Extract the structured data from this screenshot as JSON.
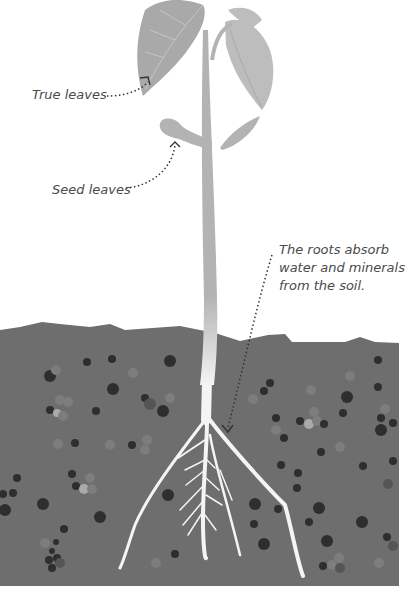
{
  "diagram": {
    "title": "",
    "labels": {
      "true_leaves": "True leaves",
      "seed_leaves": "Seed leaves",
      "roots": {
        "line1": "The roots absorb",
        "line2": "water and minerals",
        "line3": "from the soil."
      }
    },
    "parts": [
      "true-leaves",
      "seed-leaves",
      "stem",
      "roots",
      "soil"
    ],
    "colors": {
      "leaf_dark": "#a9a9a9",
      "leaf_light": "#bdbdbd",
      "stem": "#b3b3b3",
      "soil": "#6e6e6e",
      "root": "#f4f4f4",
      "pebble_dark": "#2e2e2e",
      "pebble_mid": "#555555",
      "pebble_light": "#7d7d7d",
      "text": "#4a4a4a",
      "pointer": "#333333"
    }
  }
}
